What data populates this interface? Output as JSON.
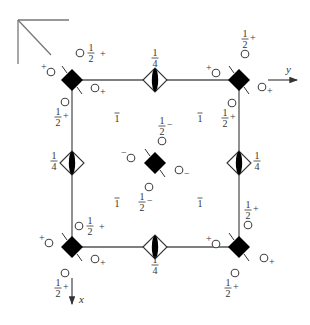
{
  "diagram": {
    "type": "space-group symmetry element diagram",
    "axes": {
      "x_label": "x",
      "y_label": "y"
    },
    "labels": {
      "half": "1/2",
      "quarter": "1/4",
      "inversion": "1̄",
      "plus": "+",
      "minus": "−"
    },
    "unit_cell": {
      "corners": [
        [
          72,
          80
        ],
        [
          239,
          80
        ],
        [
          239,
          247
        ],
        [
          72,
          247
        ]
      ]
    },
    "fourfold_rotoinversion_sites": [
      {
        "id": "corner-tl",
        "x": 72,
        "y": 80
      },
      {
        "id": "corner-tr",
        "x": 239,
        "y": 80
      },
      {
        "id": "corner-bl",
        "x": 72,
        "y": 247
      },
      {
        "id": "corner-br",
        "x": 239,
        "y": 247
      },
      {
        "id": "center",
        "x": 155,
        "y": 163
      }
    ],
    "twofold_screw_sites": [
      {
        "id": "edge-top",
        "x": 155,
        "y": 80,
        "height": "1/4",
        "label_pos": "above"
      },
      {
        "id": "edge-bottom",
        "x": 155,
        "y": 247,
        "height": "1/4",
        "label_pos": "below"
      },
      {
        "id": "edge-left",
        "x": 72,
        "y": 163,
        "height": "1/4",
        "label_pos": "left"
      },
      {
        "id": "edge-right",
        "x": 239,
        "y": 163,
        "height": "1/4",
        "label_pos": "right"
      }
    ],
    "inversion_centers": [
      {
        "x": 117,
        "y": 122
      },
      {
        "x": 200,
        "y": 122
      },
      {
        "x": 117,
        "y": 207
      },
      {
        "x": 200,
        "y": 207
      }
    ],
    "atoms": [
      {
        "x": 51,
        "y": 72,
        "sign": "+",
        "sign_pos": "tl",
        "height": ""
      },
      {
        "x": 80,
        "y": 53,
        "sign": "+",
        "sign_pos": "r",
        "height": "1/2"
      },
      {
        "x": 95,
        "y": 88,
        "sign": "+",
        "sign_pos": "br",
        "height": ""
      },
      {
        "x": 65,
        "y": 102,
        "sign": "",
        "sign_pos": "",
        "height": "1/2",
        "height_pos": "below",
        "height_sign": "+"
      },
      {
        "x": 216,
        "y": 73,
        "sign": "+",
        "sign_pos": "tl",
        "height": ""
      },
      {
        "x": 245,
        "y": 54,
        "sign": "",
        "sign_pos": "",
        "height": "1/2",
        "height_pos": "above",
        "height_sign": "+"
      },
      {
        "x": 262,
        "y": 87,
        "sign": "+",
        "sign_pos": "br",
        "height": ""
      },
      {
        "x": 232,
        "y": 103,
        "sign": "",
        "sign_pos": "",
        "height": "1/2",
        "height_pos": "below-left",
        "height_sign": "+"
      },
      {
        "x": 49,
        "y": 243,
        "sign": "+",
        "sign_pos": "tl",
        "height": ""
      },
      {
        "x": 79,
        "y": 226,
        "sign": "+",
        "sign_pos": "r",
        "height": "1/2"
      },
      {
        "x": 95,
        "y": 259,
        "sign": "+",
        "sign_pos": "br",
        "height": ""
      },
      {
        "x": 65,
        "y": 273,
        "sign": "",
        "sign_pos": "",
        "height": "1/2",
        "height_pos": "below-left",
        "height_sign": "+"
      },
      {
        "x": 216,
        "y": 244,
        "sign": "+",
        "sign_pos": "tl",
        "height": ""
      },
      {
        "x": 248,
        "y": 225,
        "sign": "",
        "sign_pos": "",
        "height": "1/2",
        "height_pos": "above",
        "height_sign": "+"
      },
      {
        "x": 264,
        "y": 258,
        "sign": "+",
        "sign_pos": "br",
        "height": ""
      },
      {
        "x": 235,
        "y": 273,
        "sign": "",
        "sign_pos": "",
        "height": "1/2",
        "height_pos": "below-left",
        "height_sign": "+"
      },
      {
        "x": 131,
        "y": 158,
        "sign": "−",
        "sign_pos": "tl",
        "height": ""
      },
      {
        "x": 162,
        "y": 141,
        "sign": "",
        "sign_pos": "",
        "height": "1/2",
        "height_pos": "above",
        "height_sign": "−"
      },
      {
        "x": 179,
        "y": 170,
        "sign": "−",
        "sign_pos": "br",
        "height": ""
      },
      {
        "x": 149,
        "y": 187,
        "sign": "",
        "sign_pos": "",
        "height": "1/2",
        "height_pos": "below",
        "height_sign": "−"
      }
    ]
  }
}
